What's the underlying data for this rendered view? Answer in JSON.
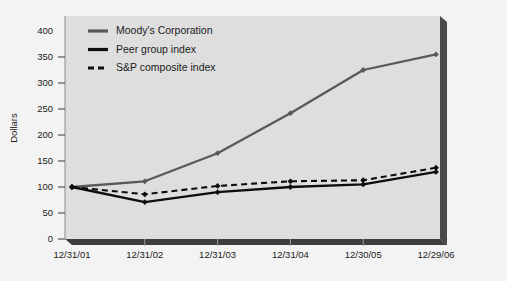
{
  "chart_data": {
    "type": "line",
    "title": "",
    "xlabel": "",
    "ylabel": "Dollars",
    "categories": [
      "12/31/01",
      "12/31/02",
      "12/31/03",
      "12/31/04",
      "12/30/05",
      "12/29/06"
    ],
    "ylim": [
      0,
      400
    ],
    "ytick_values": [
      0,
      50,
      100,
      150,
      200,
      250,
      300,
      350,
      400
    ],
    "ytick_labels": [
      "0",
      "50",
      "100",
      "150",
      "200",
      "250",
      "300",
      "350",
      "400"
    ],
    "grid": false,
    "legend_position": "top-left",
    "series": [
      {
        "name": "Moody's Corporation",
        "values": [
          100,
          111,
          165,
          242,
          325,
          355
        ],
        "color": "#595959",
        "style": "solid",
        "marker": "diamond"
      },
      {
        "name": "Peer group index",
        "values": [
          100,
          71,
          90,
          100,
          105,
          129
        ],
        "color": "#0d0d0d",
        "style": "solid",
        "marker": "diamond"
      },
      {
        "name": "S&P composite index",
        "values": [
          100,
          86,
          102,
          111,
          113,
          137
        ],
        "color": "#0d0d0d",
        "style": "dashed",
        "marker": "diamond"
      }
    ]
  },
  "legend": {
    "items": [
      {
        "label": "Moody's Corporation"
      },
      {
        "label": "Peer group index"
      },
      {
        "label": "S&P composite index"
      }
    ]
  },
  "axes": {
    "y_title": "Dollars"
  },
  "colors": {
    "plot_background": "#dedede",
    "page_background": "#f3f3f3",
    "axis_solid": "#4a4a4a",
    "moodys_line": "#595959",
    "peer_line": "#0d0d0d",
    "sp_line": "#0d0d0d",
    "text": "#1b1b1b"
  }
}
